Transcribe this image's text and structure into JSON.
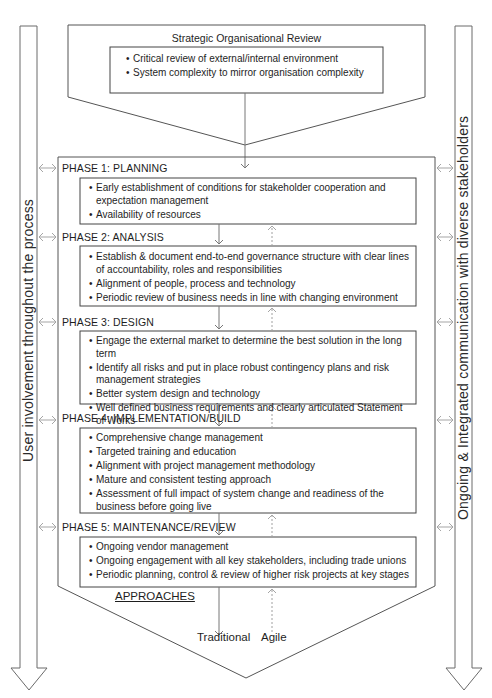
{
  "review": {
    "title": "Strategic Organisational Review",
    "items": [
      "Critical review of external/internal environment",
      "System complexity to mirror organisation complexity"
    ]
  },
  "side_bands": {
    "left": "User involvement throughout the process",
    "right": "Ongoing & Integrated communication with diverse stakeholders"
  },
  "phases": [
    {
      "label": "PHASE 1: PLANNING",
      "items": [
        "Early establishment of conditions for stakeholder cooperation and expectation management",
        "Availability of resources"
      ]
    },
    {
      "label": "PHASE 2: ANALYSIS",
      "items": [
        "Establish & document end-to-end governance structure with clear lines of accountability, roles and responsibilities",
        "Alignment of people, process and technology",
        "Periodic review of business needs in line with changing environment"
      ]
    },
    {
      "label": "PHASE 3: DESIGN",
      "items": [
        "Engage the external market to determine the best solution in the long term",
        "Identify all risks and put in place robust contingency plans and risk management strategies",
        "Better system design and technology",
        "Well defined business requirements and clearly articulated Statement of Works"
      ]
    },
    {
      "label": "PHASE 4: IMPLEMENTATION/BUILD",
      "items": [
        "Comprehensive change management",
        "Targeted training and education",
        "Alignment with project management methodology",
        "Mature and consistent testing approach",
        "Assessment of full impact of system change and readiness of the business before going live"
      ]
    },
    {
      "label": "PHASE 5: MAINTENANCE/REVIEW",
      "items": [
        "Ongoing vendor management",
        "Ongoing engagement with all key stakeholders, including trade unions",
        "Periodic planning, control & review of higher risk projects at key stages"
      ]
    }
  ],
  "approaches": {
    "heading": "APPROACHES",
    "traditional": "Traditional",
    "agile": "Agile"
  },
  "colors": {
    "line": "#555555",
    "arrow_light": "#9a9a9a",
    "text": "#1e1e1e"
  }
}
